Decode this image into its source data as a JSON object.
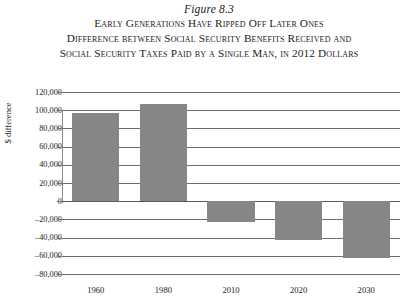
{
  "figure": {
    "number": "Figure 8.3",
    "title_lines": [
      "Early Generations Have Ripped Off Later Ones",
      "Difference between Social Security Benefits Received and",
      "Social Security Taxes Paid by a Single Man, in 2012 Dollars"
    ]
  },
  "chart_data": {
    "type": "bar",
    "title": "Early Generations Have Ripped Off Later Ones",
    "subtitle": "Difference between Social Security Benefits Received and Social Security Taxes Paid by a Single Man, in 2012 Dollars",
    "categories": [
      "1960",
      "1980",
      "2010",
      "2020",
      "2030"
    ],
    "values": [
      97000,
      107000,
      -23000,
      -43000,
      -62000
    ],
    "series": [
      {
        "name": "$ difference",
        "values": [
          97000,
          107000,
          -23000,
          -43000,
          -62000
        ]
      }
    ],
    "xlabel": "",
    "ylabel": "$ difference",
    "ylim": [
      -80000,
      120000
    ],
    "ytick_values": [
      120000,
      100000,
      80000,
      60000,
      40000,
      20000,
      0,
      -20000,
      -40000,
      -60000,
      -80000
    ],
    "ytick_labels": [
      "120,000",
      "100,000",
      "80,000",
      "60,000",
      "40,000",
      "20,000",
      "0",
      "-20,000",
      "-40,000",
      "-60,000",
      "-80,000"
    ],
    "grid": true,
    "legend": "none",
    "bar_color": "#868686",
    "background_color": "#ffffff"
  }
}
